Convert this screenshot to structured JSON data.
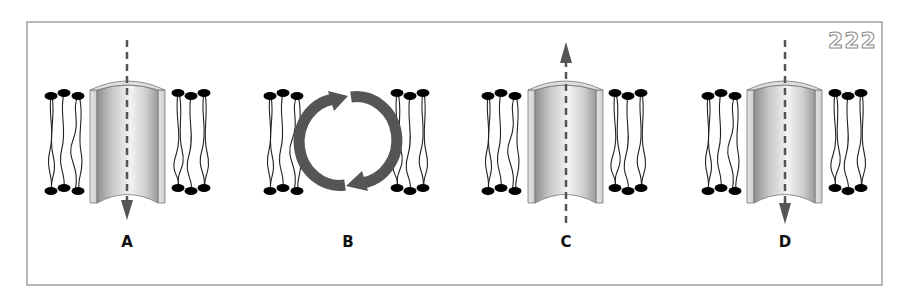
{
  "figure": {
    "page_number": "222",
    "frame": {
      "x": 27,
      "y": 22,
      "width": 855,
      "height": 263,
      "stroke": "#888888"
    },
    "colors": {
      "arrow": "#555555",
      "lipid_head": "#000000",
      "lipid_tail": "#222222",
      "channel_rim": "#d8d8d8",
      "channel_inner_light": "#f2f2f2",
      "channel_inner_dark": "#8c8c8c"
    },
    "panels": [
      {
        "id": "A",
        "label": "A",
        "description": "Channel with downward dashed arrow (inward flow)",
        "arrow_direction": "down"
      },
      {
        "id": "B",
        "label": "B",
        "description": "Lipid bilayer with circular cycling arrows (no channel)",
        "arrow_direction": "cycle"
      },
      {
        "id": "C",
        "label": "C",
        "description": "Channel with upward dashed arrow (outward flow)",
        "arrow_direction": "up"
      },
      {
        "id": "D",
        "label": "D",
        "description": "Channel with downward dashed arrow (inward flow)",
        "arrow_direction": "down"
      }
    ]
  }
}
